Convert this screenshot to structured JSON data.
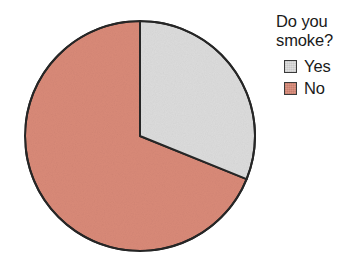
{
  "chart_data": {
    "type": "pie",
    "title": "Do you smoke?",
    "title_lines": "Do you\nsmoke?",
    "categories": [
      "Yes",
      "No"
    ],
    "values": [
      31,
      69
    ],
    "units": "percent",
    "slices": [
      {
        "label": "Yes",
        "value": 31,
        "color": "#dcdcdc",
        "start_angle_deg": 0,
        "end_angle_deg": 112
      },
      {
        "label": "No",
        "value": 69,
        "color": "#d98a78",
        "start_angle_deg": 112,
        "end_angle_deg": 360
      }
    ],
    "start_angle_deg": 0,
    "direction": "clockwise",
    "legend_position": "right",
    "grid": false,
    "xlabel": "",
    "ylabel": "",
    "outline_color": "#262626",
    "background_color": "#ffffff",
    "data_labels_shown": false
  },
  "legend": {
    "title": "Do you\nsmoke?",
    "items": [
      {
        "label": "Yes",
        "color": "#dcdcdc"
      },
      {
        "label": "No",
        "color": "#d98a78"
      }
    ]
  }
}
